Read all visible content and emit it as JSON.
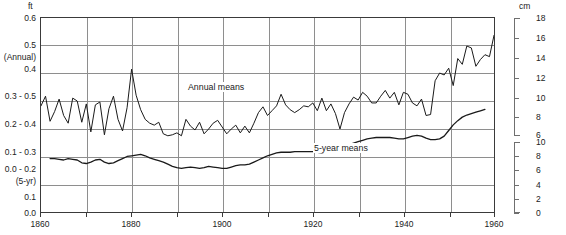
{
  "chart_data": {
    "type": "line",
    "title": "",
    "subtitle": "",
    "xlabel": "",
    "ylabel": "ft",
    "ylabel_right": "cm",
    "xlim": [
      1860,
      1960
    ],
    "grid": true,
    "legend_position": "in-plot annotations",
    "annotations": [
      {
        "text": "Annual means",
        "x": 1900,
        "y_pixel_band": "upper"
      },
      {
        "text": "5-year means",
        "x": 1922,
        "y_pixel_band": "lower"
      }
    ],
    "axis_units": {
      "left": "ft",
      "right": "cm"
    },
    "left_tick_labels": [
      "0.6",
      "0.5",
      "(Annual)",
      "0.4",
      "0.3 - 0.5",
      "0.2 - 0.4",
      "0.1 - 0.3",
      "0.0 - 0.2",
      "(5-yr)",
      "0.1",
      "0.0"
    ],
    "right_scale_upper": {
      "label": "cm",
      "ticks": [
        18,
        16,
        14,
        12,
        10,
        8,
        6
      ],
      "applies_to": "Annual means"
    },
    "right_scale_lower": {
      "label": "cm",
      "ticks": [
        10,
        8,
        6,
        4,
        2,
        0
      ],
      "applies_to": "5-year means"
    },
    "xticks": [
      1860,
      1870,
      1880,
      1890,
      1900,
      1910,
      1920,
      1930,
      1940,
      1950,
      1960
    ],
    "xtick_labels": [
      "1860",
      "",
      "1880",
      "",
      "1900",
      "",
      "1920",
      "",
      "1940",
      "",
      "1960"
    ],
    "series": [
      {
        "name": "Annual means",
        "color": "#1a1a1a",
        "x": [
          1860,
          1861,
          1862,
          1863,
          1864,
          1865,
          1866,
          1867,
          1868,
          1869,
          1870,
          1871,
          1872,
          1873,
          1874,
          1875,
          1876,
          1877,
          1878,
          1879,
          1880,
          1881,
          1882,
          1883,
          1884,
          1885,
          1886,
          1887,
          1888,
          1889,
          1890,
          1891,
          1892,
          1893,
          1894,
          1895,
          1896,
          1897,
          1898,
          1899,
          1900,
          1901,
          1902,
          1903,
          1904,
          1905,
          1906,
          1907,
          1908,
          1909,
          1910,
          1911,
          1912,
          1913,
          1914,
          1915,
          1916,
          1917,
          1918,
          1919,
          1920,
          1921,
          1922,
          1923,
          1924,
          1925,
          1926,
          1927,
          1928,
          1929,
          1930,
          1931,
          1932,
          1933,
          1934,
          1935,
          1936,
          1937,
          1938,
          1939,
          1940,
          1941,
          1942,
          1943,
          1944,
          1945,
          1946,
          1947,
          1948,
          1949,
          1950,
          1951,
          1952,
          1953,
          1954,
          1955,
          1956,
          1957,
          1958,
          1959,
          1960
        ],
        "values_cm": [
          9.0,
          10.0,
          7.4,
          8.4,
          9.7,
          8.0,
          7.2,
          9.8,
          9.5,
          7.3,
          9.2,
          6.3,
          9.1,
          9.4,
          6.0,
          8.7,
          10.0,
          7.6,
          6.4,
          8.8,
          12.8,
          10.1,
          8.6,
          7.6,
          7.2,
          7.0,
          7.3,
          6.1,
          5.9,
          6.0,
          6.2,
          5.9,
          7.6,
          6.9,
          6.5,
          7.3,
          6.1,
          6.6,
          7.2,
          7.5,
          6.8,
          6.1,
          6.6,
          7.0,
          6.2,
          6.9,
          6.2,
          7.2,
          8.3,
          8.9,
          8.0,
          8.5,
          9.0,
          10.2,
          9.1,
          8.6,
          8.3,
          8.6,
          9.0,
          8.9,
          9.3,
          8.5,
          9.8,
          8.5,
          9.2,
          8.2,
          6.6,
          8.3,
          9.2,
          9.9,
          9.6,
          10.4,
          10.0,
          9.3,
          9.3,
          10.0,
          10.6,
          9.8,
          10.4,
          9.1,
          10.4,
          10.2,
          9.3,
          9.0,
          9.7,
          8.0,
          8.1,
          11.6,
          12.4,
          12.2,
          12.9,
          11.1,
          13.9,
          13.3,
          15.2,
          15.0,
          13.1,
          13.8,
          14.3,
          14.1,
          16.3
        ]
      },
      {
        "name": "5-year means",
        "color": "#1a1a1a",
        "x": [
          1862,
          1863,
          1864,
          1865,
          1866,
          1867,
          1868,
          1869,
          1870,
          1871,
          1872,
          1873,
          1874,
          1875,
          1876,
          1877,
          1878,
          1879,
          1880,
          1881,
          1882,
          1883,
          1884,
          1885,
          1886,
          1887,
          1888,
          1889,
          1890,
          1891,
          1892,
          1893,
          1894,
          1895,
          1896,
          1897,
          1898,
          1899,
          1900,
          1901,
          1902,
          1903,
          1904,
          1905,
          1906,
          1907,
          1908,
          1909,
          1910,
          1911,
          1912,
          1913,
          1914,
          1915,
          1916,
          1917,
          1918,
          1919,
          1920,
          1921,
          1922,
          1923,
          1924,
          1925,
          1926,
          1927,
          1928,
          1929,
          1930,
          1931,
          1932,
          1933,
          1934,
          1935,
          1936,
          1937,
          1938,
          1939,
          1940,
          1941,
          1942,
          1943,
          1944,
          1945,
          1946,
          1947,
          1948,
          1949,
          1950,
          1951,
          1952,
          1953,
          1954,
          1955,
          1956,
          1957,
          1958
        ],
        "values_cm": [
          7.6,
          7.6,
          7.5,
          7.4,
          7.6,
          7.5,
          7.4,
          7.0,
          6.9,
          7.1,
          7.4,
          7.5,
          7.1,
          6.9,
          7.0,
          7.3,
          7.6,
          7.9,
          8.0,
          8.1,
          8.2,
          8.0,
          7.7,
          7.5,
          7.3,
          7.1,
          6.8,
          6.5,
          6.3,
          6.2,
          6.3,
          6.4,
          6.3,
          6.2,
          6.3,
          6.5,
          6.4,
          6.3,
          6.2,
          6.2,
          6.4,
          6.6,
          6.7,
          6.7,
          6.8,
          7.1,
          7.4,
          7.7,
          8.0,
          8.2,
          8.4,
          8.5,
          8.5,
          8.5,
          8.6,
          8.6,
          8.6,
          8.6,
          8.6,
          8.5,
          8.4,
          8.6,
          8.7,
          8.9,
          9.1,
          9.3,
          9.6,
          9.8,
          10.0,
          10.2,
          10.4,
          10.5,
          10.6,
          10.6,
          10.6,
          10.6,
          10.5,
          10.4,
          10.4,
          10.6,
          10.8,
          10.9,
          10.8,
          10.5,
          10.3,
          10.3,
          10.4,
          10.8,
          11.6,
          12.4,
          13.0,
          13.5,
          13.8,
          14.0,
          14.2,
          14.4,
          14.6
        ]
      }
    ]
  },
  "axis": {
    "unit_left": "ft",
    "unit_right": "cm",
    "left_ticks": [
      {
        "text": "0.6"
      },
      {
        "text": "0.5"
      },
      {
        "text": "(Annual)"
      },
      {
        "text": "0.4"
      },
      {
        "text": "0.3 - 0.5"
      },
      {
        "text": "0.2 - 0.4"
      },
      {
        "text": "0.1 - 0.3"
      },
      {
        "text": "0.0 - 0.2"
      },
      {
        "text": "(5-yr)"
      },
      {
        "text": "0.1"
      },
      {
        "text": "0.0"
      }
    ],
    "right_ticks_upper": [
      "18",
      "16",
      "14",
      "12",
      "10",
      "8",
      "6"
    ],
    "right_ticks_lower": [
      "10",
      "8",
      "6",
      "4",
      "2",
      "0"
    ],
    "x_labels": [
      "1860",
      "1880",
      "1900",
      "1920",
      "1940",
      "1960"
    ]
  },
  "series_labels": {
    "annual": "Annual means",
    "fiveyear": "5-year means"
  },
  "colors": {
    "line": "#1a1a1a",
    "grid": "#8e8e8e",
    "frame": "#3a3a3a",
    "text": "#222222"
  }
}
